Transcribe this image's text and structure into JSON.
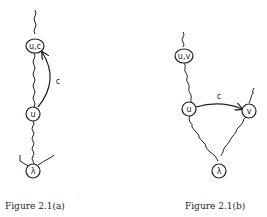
{
  "figure_a": {
    "caption": "Figure 2.1(a)",
    "nodes": [
      {
        "id": "uc",
        "label": "u,c"
      },
      {
        "id": "u",
        "label": "u"
      },
      {
        "id": "lambda",
        "label": "λ"
      }
    ],
    "edges": [
      {
        "from": "u",
        "to": "uc",
        "label": "c",
        "type": "arrow"
      }
    ]
  },
  "figure_b": {
    "caption": "Figure 2.1(b)",
    "nodes": [
      {
        "id": "uv",
        "label": "u,v"
      },
      {
        "id": "u",
        "label": "u"
      },
      {
        "id": "v",
        "label": "v"
      },
      {
        "id": "lambda",
        "label": "λ"
      }
    ],
    "edges": [
      {
        "from": "u",
        "to": "v",
        "label": "c",
        "type": "arrow"
      }
    ]
  }
}
